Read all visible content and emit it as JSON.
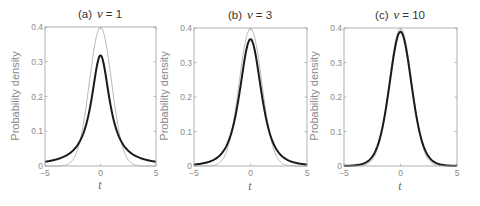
{
  "chart_data": [
    {
      "type": "line",
      "title": "(a) ν = 1",
      "panel": "(a)",
      "nu": 1,
      "xlabel": "t",
      "ylabel": "Probability density",
      "xlim": [
        -5,
        5
      ],
      "ylim": [
        0,
        0.4
      ],
      "xticks": [
        -5,
        0,
        5
      ],
      "yticks": [
        0,
        0.1,
        0.2,
        0.3,
        0.4
      ],
      "grid": false,
      "x": [
        -5,
        -4.5,
        -4,
        -3.5,
        -3,
        -2.5,
        -2,
        -1.5,
        -1,
        -0.5,
        0,
        0.5,
        1,
        1.5,
        2,
        2.5,
        3,
        3.5,
        4,
        4.5,
        5
      ],
      "series": [
        {
          "name": "Standard normal",
          "color": "#b8b8b8",
          "width": 1,
          "values": [
            1.5e-06,
            1.6e-05,
            0.00013,
            0.00087,
            0.0044,
            0.0175,
            0.054,
            0.1295,
            0.242,
            0.3521,
            0.3989,
            0.3521,
            0.242,
            0.1295,
            0.054,
            0.0175,
            0.0044,
            0.00087,
            0.00013,
            1.6e-05,
            1.5e-06
          ]
        },
        {
          "name": "Student t (ν = 1)",
          "color": "#1a1a1a",
          "width": 2,
          "values": [
            0.0122,
            0.015,
            0.0187,
            0.024,
            0.0318,
            0.0439,
            0.0637,
            0.0979,
            0.1592,
            0.2546,
            0.3183,
            0.2546,
            0.1592,
            0.0979,
            0.0637,
            0.0439,
            0.0318,
            0.024,
            0.0187,
            0.015,
            0.0122
          ]
        }
      ]
    },
    {
      "type": "line",
      "title": "(b) ν = 3",
      "panel": "(b)",
      "nu": 3,
      "xlabel": "t",
      "ylabel": "Probability density",
      "xlim": [
        -5,
        5
      ],
      "ylim": [
        0,
        0.4
      ],
      "xticks": [
        -5,
        0,
        5
      ],
      "yticks": [
        0,
        0.1,
        0.2,
        0.3,
        0.4
      ],
      "grid": false,
      "x": [
        -5,
        -4.5,
        -4,
        -3.5,
        -3,
        -2.5,
        -2,
        -1.5,
        -1,
        -0.5,
        0,
        0.5,
        1,
        1.5,
        2,
        2.5,
        3,
        3.5,
        4,
        4.5,
        5
      ],
      "series": [
        {
          "name": "Standard normal",
          "color": "#b8b8b8",
          "width": 1,
          "values": [
            1.5e-06,
            1.6e-05,
            0.00013,
            0.00087,
            0.0044,
            0.0175,
            0.054,
            0.1295,
            0.242,
            0.3521,
            0.3989,
            0.3521,
            0.242,
            0.1295,
            0.054,
            0.0175,
            0.0044,
            0.00087,
            0.00013,
            1.6e-05,
            1.5e-06
          ]
        },
        {
          "name": "Student t (ν = 3)",
          "color": "#1a1a1a",
          "width": 2,
          "values": [
            0.0042,
            0.0062,
            0.0092,
            0.0142,
            0.023,
            0.0407,
            0.0675,
            0.1176,
            0.2067,
            0.3279,
            0.3676,
            0.3279,
            0.2067,
            0.1176,
            0.0675,
            0.0407,
            0.023,
            0.0142,
            0.0092,
            0.0062,
            0.0042
          ]
        }
      ]
    },
    {
      "type": "line",
      "title": "(c) ν = 10",
      "panel": "(c)",
      "nu": 10,
      "xlabel": "t",
      "ylabel": "Probability density",
      "xlim": [
        -5,
        5
      ],
      "ylim": [
        0,
        0.4
      ],
      "xticks": [
        -5,
        0,
        5
      ],
      "yticks": [
        0,
        0.1,
        0.2,
        0.3,
        0.4
      ],
      "grid": false,
      "x": [
        -5,
        -4.5,
        -4,
        -3.5,
        -3,
        -2.5,
        -2,
        -1.5,
        -1,
        -0.5,
        0,
        0.5,
        1,
        1.5,
        2,
        2.5,
        3,
        3.5,
        4,
        4.5,
        5
      ],
      "series": [
        {
          "name": "Standard normal",
          "color": "#b8b8b8",
          "width": 1,
          "values": [
            1.5e-06,
            1.6e-05,
            0.00013,
            0.00087,
            0.0044,
            0.0175,
            0.054,
            0.1295,
            0.242,
            0.3521,
            0.3989,
            0.3521,
            0.242,
            0.1295,
            0.054,
            0.0175,
            0.0044,
            0.00087,
            0.00013,
            1.6e-05,
            1.5e-06
          ]
        },
        {
          "name": "Student t (ν = 10)",
          "color": "#1a1a1a",
          "width": 2,
          "values": [
            0.0004,
            0.00088,
            0.002,
            0.0048,
            0.0114,
            0.0269,
            0.0611,
            0.1274,
            0.2304,
            0.3397,
            0.3891,
            0.3397,
            0.2304,
            0.1274,
            0.0611,
            0.0269,
            0.0114,
            0.0048,
            0.002,
            0.00088,
            0.0004
          ]
        }
      ]
    }
  ],
  "panels": [
    {
      "label": "(a)",
      "nu_symbol": "ν",
      "nu_text": "= 1",
      "ylabel": "Probability density",
      "xlabel": "t",
      "xtick_labels": [
        "-5",
        "0",
        "5"
      ],
      "ytick_labels": [
        "0",
        "0.1",
        "0.2",
        "0.3",
        "0.4"
      ]
    },
    {
      "label": "(b)",
      "nu_symbol": "ν",
      "nu_text": "= 3",
      "ylabel": "Probability density",
      "xlabel": "t",
      "xtick_labels": [
        "-5",
        "0",
        "5"
      ],
      "ytick_labels": [
        "0",
        "0.1",
        "0.2",
        "0.3",
        "0.4"
      ]
    },
    {
      "label": "(c)",
      "nu_symbol": "ν",
      "nu_text": "= 10",
      "ylabel": "Probability density",
      "xlabel": "t",
      "xtick_labels": [
        "-5",
        "0",
        "5"
      ],
      "ytick_labels": [
        "0",
        "0.1",
        "0.2",
        "0.3",
        "0.4"
      ]
    }
  ],
  "colors": {
    "axis": "#a8a8a8",
    "normal_curve": "#b8b8b8",
    "t_curve": "#1a1a1a",
    "tick_text": "#8a8a8a"
  }
}
